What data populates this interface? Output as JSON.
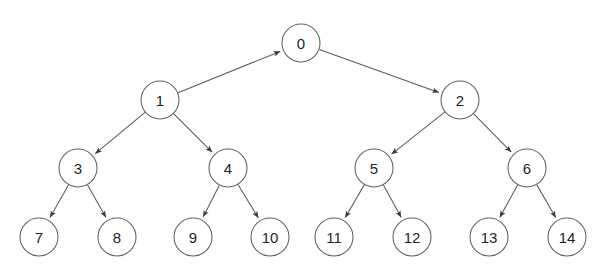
{
  "diagram": {
    "type": "tree-diagram",
    "background_color": "#ffffff",
    "node_stroke_color": "#606060",
    "node_fill_color": "#ffffff",
    "edge_color": "#5a5a5a",
    "label_color": "#1f1f1f",
    "node_radius": 19,
    "width": 615,
    "height": 272
  },
  "nodes": [
    {
      "id": "n0",
      "label": "0",
      "cx": 301,
      "cy": 43,
      "r": 19,
      "level": 0
    },
    {
      "id": "n1",
      "label": "1",
      "cx": 160,
      "cy": 100,
      "r": 19,
      "level": 1
    },
    {
      "id": "n2",
      "label": "2",
      "cx": 460,
      "cy": 100,
      "r": 19,
      "level": 1
    },
    {
      "id": "n3",
      "label": "3",
      "cx": 78,
      "cy": 168,
      "r": 19,
      "level": 2
    },
    {
      "id": "n4",
      "label": "4",
      "cx": 228,
      "cy": 168,
      "r": 19,
      "level": 2
    },
    {
      "id": "n5",
      "label": "5",
      "cx": 374,
      "cy": 168,
      "r": 19,
      "level": 2
    },
    {
      "id": "n6",
      "label": "6",
      "cx": 527,
      "cy": 168,
      "r": 19,
      "level": 2
    },
    {
      "id": "n7",
      "label": "7",
      "cx": 39,
      "cy": 237,
      "r": 19,
      "level": 3
    },
    {
      "id": "n8",
      "label": "8",
      "cx": 117,
      "cy": 237,
      "r": 19,
      "level": 3
    },
    {
      "id": "n9",
      "label": "9",
      "cx": 193,
      "cy": 237,
      "r": 19,
      "level": 3
    },
    {
      "id": "n10",
      "label": "10",
      "cx": 270,
      "cy": 237,
      "r": 19,
      "level": 3
    },
    {
      "id": "n11",
      "label": "11",
      "cx": 334,
      "cy": 237,
      "r": 19,
      "level": 3
    },
    {
      "id": "n12",
      "label": "12",
      "cx": 412,
      "cy": 237,
      "r": 19,
      "level": 3
    },
    {
      "id": "n13",
      "label": "13",
      "cx": 489,
      "cy": 237,
      "r": 19,
      "level": 3
    },
    {
      "id": "n14",
      "label": "14",
      "cx": 567,
      "cy": 237,
      "r": 19,
      "level": 3
    }
  ],
  "edges": [
    {
      "id": "e1_0",
      "from": "n1",
      "to": "n0",
      "arrow_at": "to",
      "label": "edge-1-to-0"
    },
    {
      "id": "e0_2",
      "from": "n0",
      "to": "n2",
      "arrow_at": "to",
      "label": "edge-0-to-2"
    },
    {
      "id": "e1_3",
      "from": "n1",
      "to": "n3",
      "arrow_at": "to",
      "label": "edge-1-to-3"
    },
    {
      "id": "e1_4",
      "from": "n1",
      "to": "n4",
      "arrow_at": "to",
      "label": "edge-1-to-4"
    },
    {
      "id": "e2_5",
      "from": "n2",
      "to": "n5",
      "arrow_at": "to",
      "label": "edge-2-to-5"
    },
    {
      "id": "e2_6",
      "from": "n2",
      "to": "n6",
      "arrow_at": "to",
      "label": "edge-2-to-6"
    },
    {
      "id": "e3_7",
      "from": "n3",
      "to": "n7",
      "arrow_at": "to",
      "label": "edge-3-to-7"
    },
    {
      "id": "e3_8",
      "from": "n3",
      "to": "n8",
      "arrow_at": "to",
      "label": "edge-3-to-8"
    },
    {
      "id": "e4_9",
      "from": "n4",
      "to": "n9",
      "arrow_at": "to",
      "label": "edge-4-to-9"
    },
    {
      "id": "e4_10",
      "from": "n4",
      "to": "n10",
      "arrow_at": "to",
      "label": "edge-4-to-10"
    },
    {
      "id": "e5_11",
      "from": "n5",
      "to": "n11",
      "arrow_at": "to",
      "label": "edge-5-to-11"
    },
    {
      "id": "e5_12",
      "from": "n5",
      "to": "n12",
      "arrow_at": "to",
      "label": "edge-5-to-12"
    },
    {
      "id": "e6_13",
      "from": "n6",
      "to": "n13",
      "arrow_at": "to",
      "label": "edge-6-to-13"
    },
    {
      "id": "e6_14",
      "from": "n6",
      "to": "n14",
      "arrow_at": "to",
      "label": "edge-6-to-14"
    }
  ]
}
